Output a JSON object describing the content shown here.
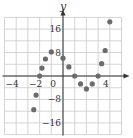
{
  "chart_data": {
    "type": "scatter",
    "title": "",
    "xlabel": "x",
    "ylabel": "y",
    "xlim": [
      -5,
      5
    ],
    "ylim": [
      -20,
      20
    ],
    "grid": true,
    "grid_step": {
      "x": 1,
      "y": 4
    },
    "x_ticks": [
      {
        "value": -4,
        "label": "-4"
      },
      {
        "value": -2,
        "label": "-2"
      },
      {
        "value": 0,
        "label": "0"
      },
      {
        "value": 4,
        "label": "4"
      }
    ],
    "y_ticks": [
      {
        "value": 16,
        "label": "16"
      },
      {
        "value": 8,
        "label": "8"
      },
      {
        "value": -8,
        "label": "-8"
      },
      {
        "value": -16,
        "label": "-16"
      }
    ],
    "point_color": "#6b6b6b",
    "series": [
      {
        "name": "data",
        "points": [
          {
            "x": -2.5,
            "y": -11.5
          },
          {
            "x": -2.3,
            "y": -6.5
          },
          {
            "x": -2.0,
            "y": 0
          },
          {
            "x": -1.8,
            "y": 2.7
          },
          {
            "x": -1.5,
            "y": 5.8
          },
          {
            "x": -1.0,
            "y": 8.2
          },
          {
            "x": 0.0,
            "y": 6.1
          },
          {
            "x": 0.5,
            "y": 3.1
          },
          {
            "x": 1.0,
            "y": 0
          },
          {
            "x": 1.5,
            "y": -2.7
          },
          {
            "x": 2.0,
            "y": -4.4
          },
          {
            "x": 2.5,
            "y": -2.7
          },
          {
            "x": 3.0,
            "y": 0
          },
          {
            "x": 3.3,
            "y": 4.2
          },
          {
            "x": 3.6,
            "y": 8.7
          },
          {
            "x": 4.0,
            "y": 18.5
          }
        ]
      }
    ]
  }
}
